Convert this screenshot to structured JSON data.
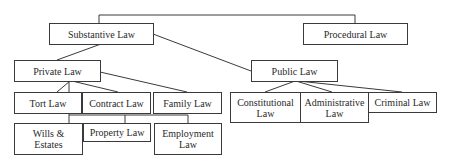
{
  "diagram": {
    "type": "hierarchy",
    "colors": {
      "line": "#3a3a3a",
      "text": "#2a2a2a",
      "background": "#ffffff"
    },
    "nodes": {
      "substantive": "Substantive Law",
      "procedural": "Procedural Law",
      "private": "Private Law",
      "public": "Public Law",
      "tort": "Tort Law",
      "contract": "Contract Law",
      "family": "Family Law",
      "constitutional": "Constitutional Law",
      "administrative": "Administrative Law",
      "criminal": "Criminal Law",
      "wills": "Wills & Estates",
      "property": "Property Law",
      "employment": "Employment Law"
    },
    "edges": [
      [
        "substantive",
        "procedural"
      ],
      [
        "substantive",
        "private"
      ],
      [
        "substantive",
        "public"
      ],
      [
        "private",
        "tort"
      ],
      [
        "private",
        "contract"
      ],
      [
        "private",
        "family"
      ],
      [
        "private",
        "wills"
      ],
      [
        "private",
        "property"
      ],
      [
        "private",
        "employment"
      ],
      [
        "public",
        "constitutional"
      ],
      [
        "public",
        "administrative"
      ],
      [
        "public",
        "criminal"
      ]
    ]
  }
}
